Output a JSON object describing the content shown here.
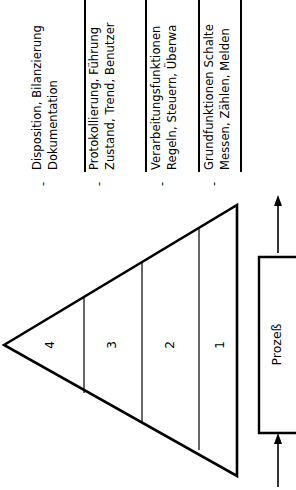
{
  "diagram": {
    "orientation": "rotated-90",
    "levels": [
      {
        "number": "4",
        "heading": "Disposition, Bilanzierung",
        "detail": "Dokumentation",
        "bullet": "-"
      },
      {
        "number": "3",
        "heading": "Protokollierung, Führung",
        "detail": "Zustand, Trend, Benutzer",
        "bullet": "-"
      },
      {
        "number": "2",
        "heading": "Verarbeitungsfunktionen",
        "detail": "Regeln, Steuern, Überwa",
        "bullet": "-"
      },
      {
        "number": "1",
        "heading": "Grundfunktionen  Schalte",
        "detail": "Messen, Zählen, Melden",
        "bullet": "-"
      }
    ],
    "process_box": {
      "label": "Prozeß"
    },
    "colors": {
      "stroke": "#000000",
      "background": "#ffffff"
    }
  }
}
